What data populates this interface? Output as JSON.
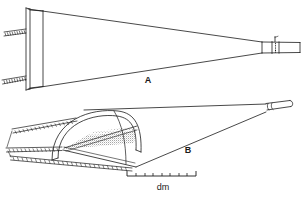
{
  "figure": {
    "kind": "technical-line-drawing",
    "background_color": "#ffffff",
    "ink_color": "#1a1a1a",
    "panels": [
      {
        "id": "A",
        "label": "A",
        "view": "profile / side elevation",
        "description": "Elongated tapering horn-shaped body, wide flared mouth at left with lashed edge bindings, narrowing to a tubular collared nozzle at right",
        "label_position": {
          "x": 148,
          "y": 83
        }
      },
      {
        "id": "B",
        "label": "B",
        "view": "three-quarter perspective",
        "description": "Same object seen obliquely showing the arched domed mouth opening with stippled shaded interior, lashed seam cords running to the left, tapering to the tubular nozzle at right",
        "label_position": {
          "x": 188,
          "y": 153
        }
      }
    ],
    "scale_bar": {
      "unit_label": "dm",
      "unit_label_position": {
        "x": 163,
        "y": 190
      },
      "x_start": 127,
      "x_end": 196,
      "y": 176,
      "tick_count": 8,
      "end_cap_height": 5,
      "tick_height": 3
    }
  }
}
